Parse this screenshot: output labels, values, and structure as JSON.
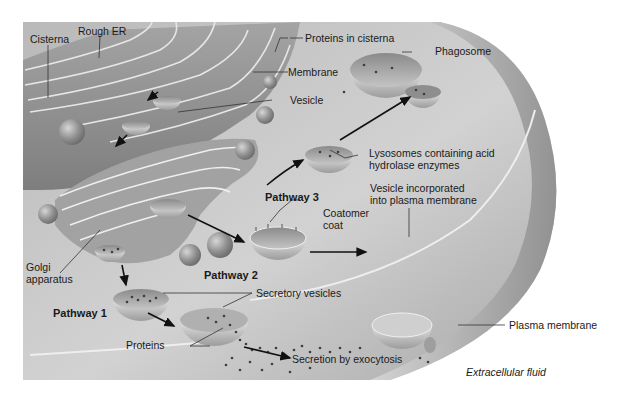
{
  "figure": {
    "colors": {
      "background": "#ffffff",
      "cytoplasm": "#c8c8c8",
      "cytoplasm_dark": "#8e8e8e",
      "organelle": "#9a9a9a",
      "organelle_light": "#bdbdbd",
      "membrane_highlight": "#eeeeee",
      "dots": "#4a4a4a",
      "label_text": "#1a1a1a",
      "leader_line": "#333333"
    }
  },
  "labels": {
    "rough_er": "Rough ER",
    "cisterna": "Cisterna",
    "proteins_in_cisterna": "Proteins in cisterna",
    "membrane": "Membrane",
    "vesicle": "Vesicle",
    "phagosome": "Phagosome",
    "lysosomes_line1": "Lysosomes containing acid",
    "lysosomes_line2": "hydrolase enzymes",
    "vesicle_incorporated_line1": "Vesicle incorporated",
    "vesicle_incorporated_line2": "into plasma membrane",
    "pathway_3": "Pathway 3",
    "coatomer_line1": "Coatomer",
    "coatomer_line2": "coat",
    "golgi_line1": "Golgi",
    "golgi_line2": "apparatus",
    "pathway_2": "Pathway 2",
    "pathway_1": "Pathway 1",
    "secretory_vesicles": "Secretory vesicles",
    "plasma_membrane": "Plasma membrane",
    "proteins": "Proteins",
    "secretion_by_exocytosis": "Secretion by exocytosis",
    "extracellular_fluid": "Extracellular fluid"
  }
}
